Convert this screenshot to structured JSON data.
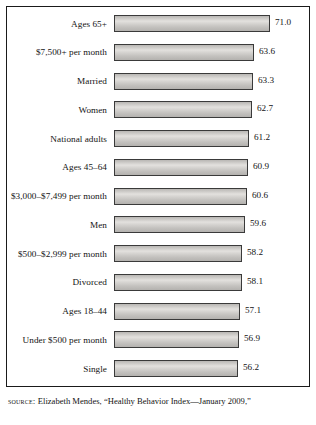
{
  "chart_data": {
    "type": "bar",
    "orientation": "horizontal",
    "title": "",
    "xlabel": "",
    "ylabel": "",
    "grid": false,
    "legend": null,
    "xlim": [
      0,
      75
    ],
    "categories": [
      "Ages 65+",
      "$7,500+ per month",
      "Married",
      "Women",
      "National adults",
      "Ages 45–64",
      "$3,000–$7,499 per month",
      "Men",
      "$500–$2,999 per month",
      "Divorced",
      "Ages 18–44",
      "Under $500 per month",
      "Single"
    ],
    "values": [
      71.0,
      63.6,
      63.3,
      62.7,
      61.2,
      60.9,
      60.6,
      59.6,
      58.2,
      58.1,
      57.1,
      56.9,
      56.2
    ],
    "value_labels": [
      "71.0",
      "63.6",
      "63.3",
      "62.7",
      "61.2",
      "60.9",
      "60.6",
      "59.6",
      "58.2",
      "58.1",
      "57.1",
      "56.9",
      "56.2"
    ]
  },
  "source": {
    "label": "source:",
    "text": " Elizabeth Mendes, “Healthy Behavior Index—January 2009,”"
  }
}
